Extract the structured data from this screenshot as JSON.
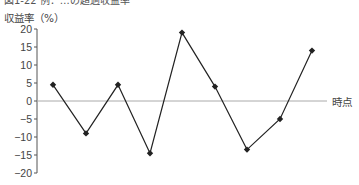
{
  "chart_data": {
    "type": "line",
    "title": "図1-22 例：…の超過収益率",
    "xlabel": "時点",
    "ylabel": "収益率（%）",
    "x": [
      1,
      2,
      3,
      4,
      5,
      6,
      7,
      8,
      9
    ],
    "series": [
      {
        "name": "収益率",
        "values": [
          4.5,
          -9,
          4.5,
          -14.5,
          19,
          4,
          -13.5,
          -5,
          14
        ],
        "marker": "diamond",
        "color": "#222222"
      }
    ],
    "ylim": [
      -20,
      20
    ],
    "yticks": [
      20,
      15,
      10,
      5,
      0,
      -5,
      -10,
      -15,
      -20
    ],
    "ytick_labels": [
      "20",
      "15",
      "10",
      "5",
      "0",
      "−5",
      "−10",
      "−15",
      "−20"
    ],
    "grid": false,
    "legend": null,
    "zero_line_color": "#aaaaaa"
  }
}
